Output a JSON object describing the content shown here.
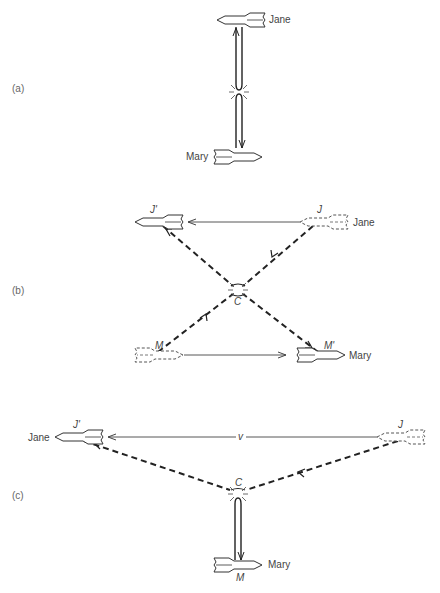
{
  "diagram": {
    "panels": [
      {
        "id": "a",
        "label": "(a)",
        "rockets": [
          {
            "name": "Jane",
            "label": "Jane",
            "style": "solid",
            "direction": "left"
          },
          {
            "name": "Mary",
            "label": "Mary",
            "style": "solid",
            "direction": "right"
          }
        ],
        "description": "Jane and Mary exchange signals along a vertical path; a collision/flash event marked midway."
      },
      {
        "id": "b",
        "label": "(b)",
        "rockets": [
          {
            "name": "J-prime",
            "label": "J'",
            "style": "solid"
          },
          {
            "name": "J",
            "label": "J",
            "style": "dashed",
            "side_label": "Jane"
          },
          {
            "name": "M",
            "label": "M",
            "style": "dashed"
          },
          {
            "name": "M-prime",
            "label": "M'",
            "style": "solid",
            "side_label": "Mary"
          }
        ],
        "event_label": "C"
      },
      {
        "id": "c",
        "label": "(c)",
        "rockets": [
          {
            "name": "J-prime",
            "label": "J'",
            "style": "solid",
            "side_label": "Jane"
          },
          {
            "name": "J",
            "label": "J",
            "style": "dashed"
          },
          {
            "name": "M",
            "label": "M",
            "style": "solid",
            "side_label": "Mary"
          }
        ],
        "velocity_label": "v",
        "event_label": "C"
      }
    ]
  },
  "labels": {
    "a": "(a)",
    "b": "(b)",
    "c": "(c)",
    "jane": "Jane",
    "mary": "Mary",
    "j": "J",
    "j_prime": "J'",
    "m": "M",
    "m_prime": "M'",
    "c_event": "C",
    "v": "v"
  }
}
